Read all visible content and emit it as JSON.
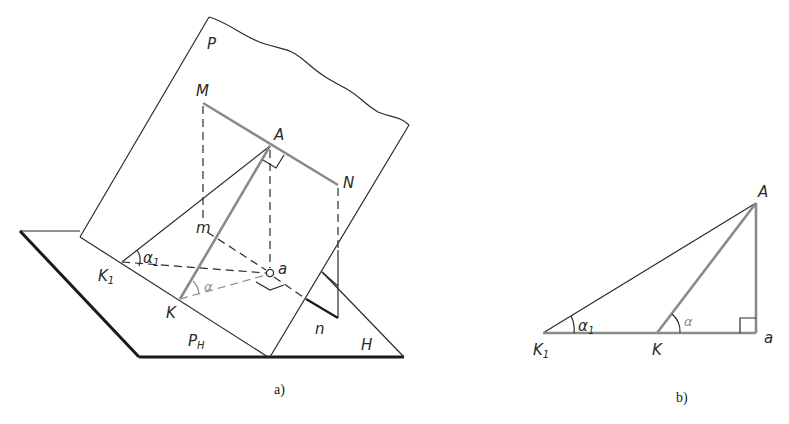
{
  "figure_a": {
    "caption": "a)",
    "labels": {
      "plane_p": "P",
      "point_m_upper": "M",
      "point_a_upper": "A",
      "point_n_upper": "N",
      "point_m_lower": "m",
      "point_a_lower": "a",
      "point_n_lower": "n",
      "point_k1": "K",
      "point_k1_sub": "1",
      "point_k": "K",
      "angle_alpha1": "α",
      "angle_alpha1_sub": "1",
      "angle_alpha": "α",
      "trace_ph": "P",
      "trace_ph_sub": "H",
      "plane_h": "H"
    }
  },
  "figure_b": {
    "caption": "b)",
    "labels": {
      "point_a_upper": "A",
      "point_a_lower": "a",
      "point_k1": "K",
      "point_k1_sub": "1",
      "point_k": "K",
      "angle_alpha1": "α",
      "angle_alpha1_sub": "1",
      "angle_alpha": "α"
    }
  },
  "colors": {
    "line": "#2b2b2b",
    "thick_edge": "#1a1a1a",
    "highlight_gray": "#8a8a8a",
    "background": "#ffffff"
  }
}
